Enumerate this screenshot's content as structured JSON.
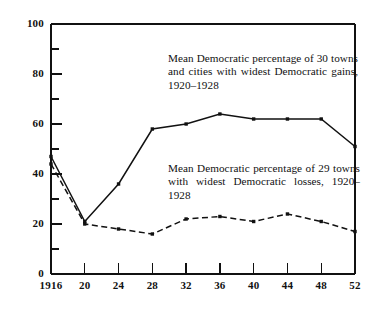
{
  "chart_data": {
    "type": "line",
    "title": "",
    "xlabel": "",
    "ylabel": "",
    "x": [
      1916,
      1920,
      1924,
      1928,
      1932,
      1936,
      1940,
      1944,
      1948,
      1952
    ],
    "xtick_labels": [
      "1916",
      "20",
      "24",
      "28",
      "32",
      "36",
      "40",
      "44",
      "48",
      "52"
    ],
    "ytick_labels": [
      "0",
      "20",
      "40",
      "60",
      "80",
      "100"
    ],
    "ytick_values": [
      0,
      20,
      40,
      60,
      80,
      100
    ],
    "yminor_values": [
      10,
      30,
      50,
      70,
      90
    ],
    "xlim": [
      1916,
      1952
    ],
    "ylim": [
      0,
      100
    ],
    "grid": false,
    "legend": "none",
    "series": [
      {
        "name": "Mean Democratic percentage of 30 towns and cities with widest Democratic gains, 1920-1928",
        "style": "solid",
        "marker": "square",
        "values": [
          47,
          21,
          36,
          58,
          60,
          64,
          62,
          62,
          62,
          51
        ]
      },
      {
        "name": "Mean Democratic percentage of 29 towns with widest Democratic losses, 1920-1928",
        "style": "dashed",
        "marker": "square",
        "values": [
          44,
          20,
          18,
          16,
          22,
          23,
          21,
          24,
          21,
          17
        ]
      }
    ],
    "annotations": [
      {
        "id": "gains",
        "text": "Mean Democratic percentage of 30 towns and cities with widest Democratic gains, 1920–1928"
      },
      {
        "id": "losses",
        "text": "Mean Democratic percentage of 29 towns with widest Democratic losses, 1920–1928"
      }
    ]
  },
  "colors": {
    "axis": "#111111",
    "series_gains": "#111111",
    "series_losses": "#111111",
    "background": "#ffffff"
  }
}
